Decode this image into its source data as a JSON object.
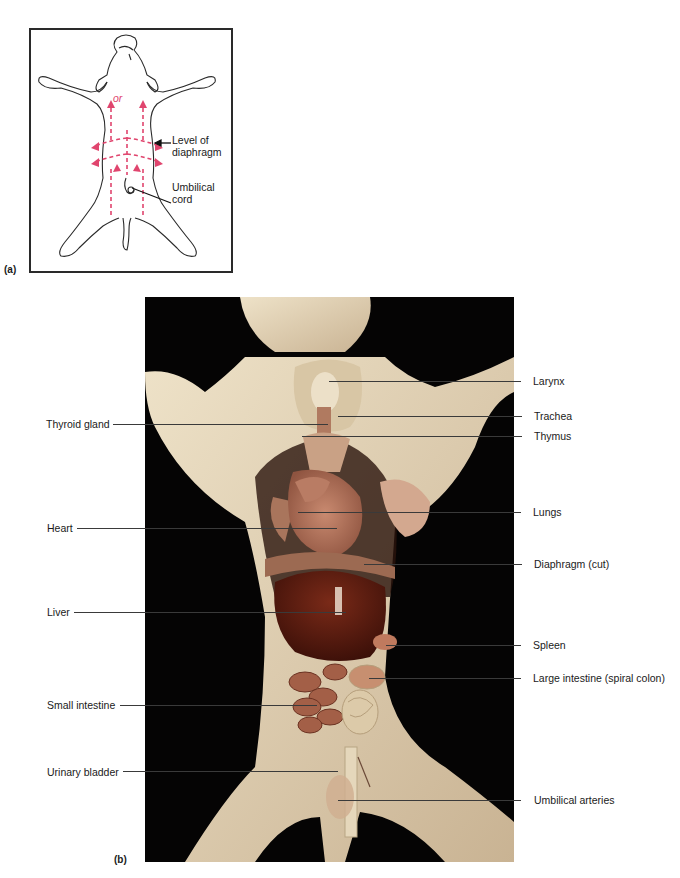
{
  "figure": {
    "panel_a": {
      "label": "(a)",
      "center_text": "or",
      "callouts": [
        {
          "id": "diaphragm-level",
          "text_line1": "Level of",
          "text_line2": "diaphragm"
        },
        {
          "id": "umbilical-cord",
          "text_line1": "Umbilical",
          "text_line2": "cord"
        }
      ],
      "arrow_color": "#e0456e",
      "outline_color": "#2a2a2a"
    },
    "panel_b": {
      "label": "(b)",
      "left_callouts": [
        {
          "text": "Thyroid gland"
        },
        {
          "text": "Heart"
        },
        {
          "text": "Liver"
        },
        {
          "text": "Small intestine"
        },
        {
          "text": "Urinary bladder"
        }
      ],
      "right_callouts": [
        {
          "text": "Larynx"
        },
        {
          "text": "Trachea"
        },
        {
          "text": "Thymus"
        },
        {
          "text": "Lungs"
        },
        {
          "text": "Diaphragm (cut)"
        },
        {
          "text": "Spleen"
        },
        {
          "text": "Large intestine (spiral colon)"
        },
        {
          "text": "Umbilical arteries"
        }
      ],
      "colors": {
        "background": "#050404",
        "skin": "#e6d8bd",
        "skin_shadow": "#bfa98a",
        "heart": "#b5735a",
        "lungs": "#c08870",
        "liver": "#5a1c10",
        "intestine": "#9c5a44",
        "colon": "#d9c4a4"
      }
    }
  }
}
